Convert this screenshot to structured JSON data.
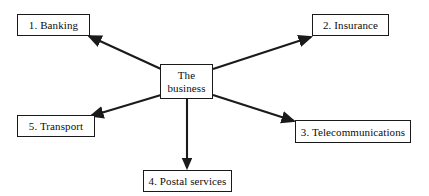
{
  "diagram": {
    "type": "hub-and-spoke",
    "background_color": "#ffffff",
    "line_color": "#1a1a1a",
    "text_color": "#0d0d0d",
    "center": {
      "label": "The business",
      "name": "center-node-the-business"
    },
    "nodes": [
      {
        "label": "1. Banking",
        "name": "node-banking"
      },
      {
        "label": "2. Insurance",
        "name": "node-insurance"
      },
      {
        "label": "3. Telecommunications",
        "name": "node-telecommunications"
      },
      {
        "label": "4. Postal services",
        "name": "node-postal-services"
      },
      {
        "label": "5. Transport",
        "name": "node-transport"
      }
    ],
    "connectors": [
      {
        "name": "arrow-to-banking",
        "direction": "center-to-upper-left"
      },
      {
        "name": "arrow-to-insurance",
        "direction": "center-to-upper-right"
      },
      {
        "name": "arrow-to-telecommunications",
        "direction": "center-to-lower-right"
      },
      {
        "name": "arrow-to-postal-services",
        "direction": "center-to-down"
      },
      {
        "name": "arrow-to-transport",
        "direction": "center-to-lower-left"
      }
    ]
  }
}
